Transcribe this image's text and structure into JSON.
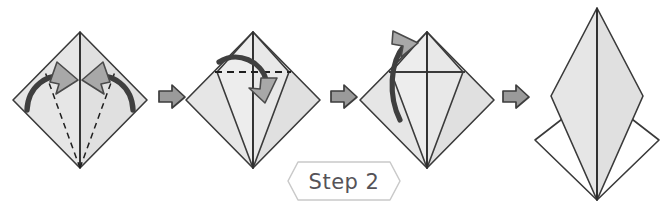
{
  "document": {
    "title": "Origami Folding Instructions",
    "step_label": "Step 2",
    "background_color": "#ffffff"
  },
  "palette": {
    "paper_fill": "#e3e3e3",
    "paper_fill_light": "#ececec",
    "paper_fill_shaded": "#dcdcdc",
    "paper_stroke": "#3a3a3a",
    "fold_line": "#2f2f2f",
    "dashed_line": "#1f1f1f",
    "arrow_fill": "#a8a8a8",
    "arrow_stroke": "#4a4a4a",
    "separator_arrow_fill": "#9a9a9a",
    "separator_arrow_stroke": "#3d3d3d",
    "banner_stroke": "#c9c9c9",
    "banner_fill": "#ffffff",
    "banner_text": "#555358",
    "white_paper": "#ffffff"
  },
  "figures": [
    {
      "id": "figure-1",
      "name": "diamond-with-inward-fold-arrows",
      "order": 1,
      "caption": "",
      "shape": "diamond",
      "center_x": 80,
      "top_y": 32,
      "bottom_y": 168,
      "half_width": 67,
      "fold_lines": [
        "vertical-center-crease"
      ],
      "guide_lines": [
        "dashed-left-fold",
        "dashed-right-fold"
      ],
      "arrows": [
        "curved-arrow-left-inward",
        "curved-arrow-right-inward"
      ],
      "description": "Square base diamond with vertical crease and two dashed fold guides converging at the bottom point; two curved arrows indicate folding the lower edges inward to the center line."
    },
    {
      "id": "figure-2",
      "name": "kite-with-top-flap-dashed",
      "order": 2,
      "caption": "",
      "shape": "diamond",
      "center_x": 253,
      "top_y": 32,
      "bottom_y": 168,
      "half_width": 67,
      "fold_lines": [
        "vertical-center-crease",
        "left-kite-edge",
        "right-kite-edge"
      ],
      "guide_lines": [
        "dashed-horizontal-fold"
      ],
      "arrows": [
        "curved-arrow-fold-down"
      ],
      "description": "Edges now folded in forming a kite; a horizontal dashed line across the upper section with a curved arrow pointing down shows the top triangle folding forward."
    },
    {
      "id": "figure-3",
      "name": "kite-with-unfold-arrow",
      "order": 3,
      "caption": "",
      "shape": "diamond",
      "center_x": 427,
      "top_y": 32,
      "bottom_y": 168,
      "half_width": 67,
      "fold_lines": [
        "vertical-center-crease",
        "solid-horizontal-crease",
        "left-kite-edge",
        "right-kite-edge"
      ],
      "guide_lines": [],
      "arrows": [
        "curved-arrow-lift-up"
      ],
      "description": "The horizontal crease is now solid; a long curved arrow sweeps upward and out of the top, indicating a petal fold lifting the flap up."
    },
    {
      "id": "figure-4",
      "name": "completed-petal-fold",
      "order": 4,
      "caption": "",
      "shape": "tall-kite-over-diamond",
      "center_x": 597,
      "top_y": 8,
      "bottom_y": 200,
      "half_width": 62,
      "fold_lines": [
        "vertical-center-crease",
        "tall-kite-outline",
        "lower-diamond-outline"
      ],
      "guide_lines": [],
      "arrows": [],
      "description": "Result of the petal fold: a tall narrow shaded kite standing above a white diamond, both meeting at the bottom point."
    }
  ],
  "separators": [
    {
      "id": "separator-1",
      "name": "progress-arrow",
      "x": 170,
      "y": 96,
      "direction": "right"
    },
    {
      "id": "separator-2",
      "name": "progress-arrow",
      "x": 342,
      "y": 96,
      "direction": "right"
    },
    {
      "id": "separator-3",
      "name": "progress-arrow",
      "x": 514,
      "y": 96,
      "direction": "right"
    }
  ],
  "banner": {
    "id": "step-banner",
    "name": "step-label-banner",
    "text": "Step 2",
    "shape": "hexagon",
    "x": 288,
    "y": 162,
    "width": 112,
    "height": 38
  }
}
